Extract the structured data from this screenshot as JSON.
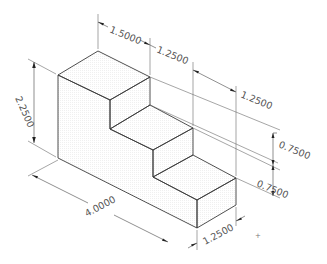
{
  "drawing": {
    "title": "Isometric stair block with dimensions",
    "colors": {
      "background": "#ffffff",
      "face_top": "#c4c4c4",
      "face_left": "#d8d8d8",
      "face_right": "#cdcdcd",
      "edge": "#3c3c3c",
      "dim_text": "#555555"
    },
    "dimensions": {
      "top_step_depth": "1.5000",
      "middle_step_depth": "1.2500",
      "bottom_step_depth": "1.2500",
      "overall_height": "2.2500",
      "upper_riser": "0.7500",
      "lower_riser": "0.7500",
      "overall_length": "4.0000",
      "width": "1.2500"
    },
    "marker": "+"
  }
}
